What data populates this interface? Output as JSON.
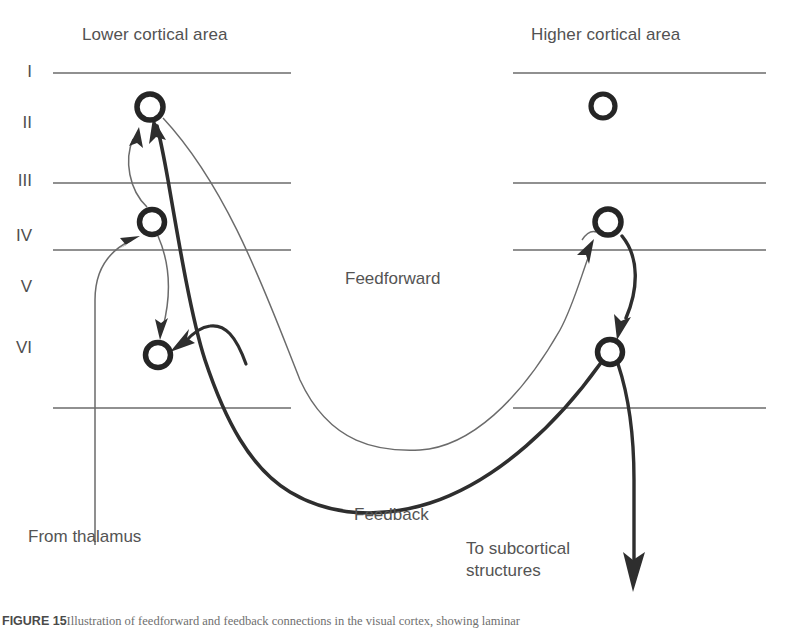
{
  "figure": {
    "title_left": "Lower cortical area",
    "title_right": "Higher cortical area",
    "background_color": "#ffffff",
    "ink_color": "#3a3a3a",
    "text_color": "#4f4f4f",
    "thin_line_color": "#6d6d6d"
  },
  "layers": [
    {
      "numeral": "I"
    },
    {
      "numeral": "II"
    },
    {
      "numeral": "III"
    },
    {
      "numeral": "IV"
    },
    {
      "numeral": "V"
    },
    {
      "numeral": "VI"
    }
  ],
  "labels": {
    "feedforward": "Feedforward",
    "feedback": "Feedback",
    "from_thalamus": "From thalamus",
    "to_subcortical_line1": "To subcortical",
    "to_subcortical_line2": "structures"
  },
  "neurons": [
    {
      "id": "lower-layer2-neuron",
      "area": "lower",
      "layer": "II"
    },
    {
      "id": "lower-layer4-neuron",
      "area": "lower",
      "layer": "IV"
    },
    {
      "id": "lower-layer6-neuron",
      "area": "lower",
      "layer": "VI"
    },
    {
      "id": "higher-layer2-neuron",
      "area": "higher",
      "layer": "II"
    },
    {
      "id": "higher-layer4-neuron",
      "area": "higher",
      "layer": "IV"
    },
    {
      "id": "higher-layer6-neuron",
      "area": "higher",
      "layer": "VI"
    }
  ],
  "connections": [
    {
      "id": "feedforward-projection",
      "style": "thin",
      "from": "lower-layer2-neuron",
      "to": "higher-layer4-neuron"
    },
    {
      "id": "feedback-projection",
      "style": "thick",
      "from": "higher-layer6-neuron",
      "to": "lower-layer2-neuron"
    },
    {
      "id": "feedback-to-layer6",
      "style": "thick",
      "from": "higher-layer6-neuron",
      "to": "lower-layer6-neuron"
    },
    {
      "id": "thalamic-input",
      "style": "thin",
      "from": "thalamus",
      "to": "lower-layer4-neuron"
    },
    {
      "id": "intracolumnar-4-to-6",
      "style": "thin",
      "from": "lower-layer4-neuron",
      "to": "lower-layer6-neuron"
    },
    {
      "id": "intracolumnar-4-to-2",
      "style": "thin",
      "from": "lower-layer4-neuron",
      "to": "lower-layer2-neuron"
    },
    {
      "id": "higher-4-to-6",
      "style": "thick",
      "from": "higher-layer4-neuron",
      "to": "higher-layer6-neuron"
    },
    {
      "id": "subcortical-output",
      "style": "thick",
      "from": "higher-layer6-neuron",
      "to": "subcortical-structures"
    }
  ],
  "caption": {
    "figure_number": "FIGURE 15",
    "text": "Illustration of feedforward and feedback connections in the visual cortex, showing laminar"
  }
}
